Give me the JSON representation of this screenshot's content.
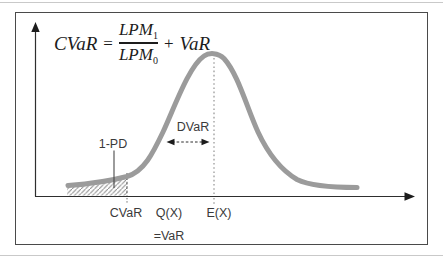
{
  "formula": {
    "lhs": "CVaR",
    "equals_sign": "=",
    "numerator": "LPM",
    "numerator_subscript": "1",
    "denominator": "LPM",
    "denominator_subscript": "0",
    "plus_sign": "+",
    "addend": "VaR"
  },
  "annotations": {
    "tail_probability_label": "1-PD",
    "dvar_label": "DVaR"
  },
  "x_axis_labels": {
    "cvar": "CVaR",
    "quantile": "Q(X)",
    "quantile_equals": "=VaR",
    "expected_value": "E(X)"
  },
  "colors": {
    "curve": "#9b9b9b",
    "axis": "#2e2e2e",
    "hatch_lines": "#8a8a8a",
    "label_text": "#3a3a3a",
    "formula_text": "#1c1c1c",
    "frame_border": "#4a4a4a",
    "dotted_guide": "#9a9a9a",
    "page_rule": "#c9c9c9"
  }
}
